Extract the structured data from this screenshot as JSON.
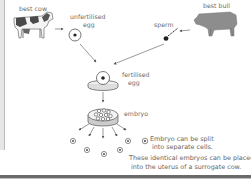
{
  "diagram": {
    "nodes": {
      "best_cow": {
        "label": "best cow"
      },
      "unfertilised_egg": {
        "label_line1": "unfertilised",
        "label_line2": "egg"
      },
      "sperm": {
        "label": "sperm"
      },
      "best_bull": {
        "label": "best bull"
      },
      "fertilised_egg": {
        "label_line1": "fertilised",
        "label_line2": "egg"
      },
      "embryo": {
        "label": "embryo"
      }
    },
    "captions": {
      "split_line1": "Embryo can be split",
      "split_line2": "into separate cells.",
      "implant_line1": "These identical embryos can be placed",
      "implant_line2": "into the uterus of a surrogate cow."
    },
    "edges": [
      {
        "from": "best_cow",
        "to": "unfertilised_egg"
      },
      {
        "from": "best_bull",
        "to": "sperm"
      },
      {
        "from": "unfertilised_egg",
        "to": "fertilised_egg"
      },
      {
        "from": "sperm",
        "to": "fertilised_egg"
      },
      {
        "from": "fertilised_egg",
        "to": "embryo"
      },
      {
        "from": "embryo",
        "to": "separate_cells",
        "count": 6
      }
    ],
    "separate_cell_count": 6,
    "colors": {
      "line": "#555555",
      "text": "#666666",
      "animal_fill": "#8a8a8a",
      "border": "#6a6a6a"
    }
  }
}
